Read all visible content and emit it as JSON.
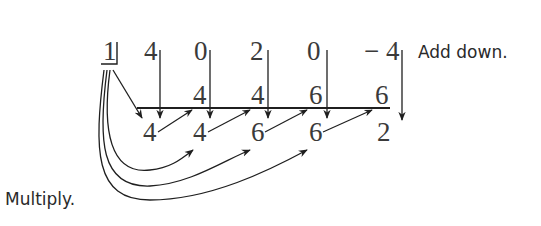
{
  "diagram": {
    "type": "synthetic-division",
    "divisor": "1",
    "coefficients": [
      "4",
      "0",
      "2",
      "0",
      "− 4"
    ],
    "products": [
      "4",
      "4",
      "6",
      "6"
    ],
    "results": [
      "4",
      "4",
      "6",
      "6",
      "2"
    ],
    "labels": {
      "add": "Add down.",
      "multiply": "Multiply."
    }
  }
}
